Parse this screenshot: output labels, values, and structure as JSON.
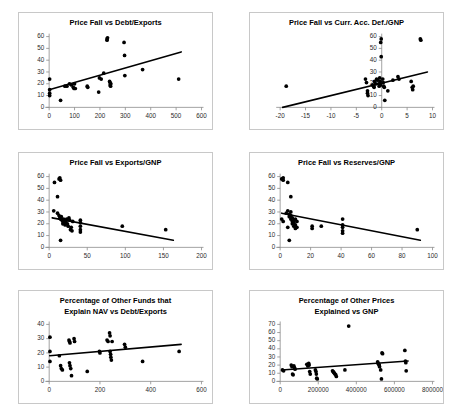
{
  "figure": {
    "background_color": "#ffffff",
    "panel_border_color": "#c8c8c8",
    "marker_color": "#000000",
    "trendline_color": "#000000",
    "axis_color": "#8a8a8a"
  },
  "chart_data": [
    {
      "id": "price-fall-vs-debt-exports",
      "type": "scatter",
      "title": "Price Fall vs Debt/Exports",
      "title_lines": [
        "Price Fall vs Debt/Exports"
      ],
      "xlabel": "",
      "ylabel": "",
      "xlim": [
        0,
        600
      ],
      "ylim": [
        0,
        60
      ],
      "xticks": [
        0,
        100,
        200,
        300,
        400,
        500,
        600
      ],
      "yticks": [
        0,
        10,
        20,
        30,
        40,
        50,
        60
      ],
      "grid": false,
      "legend": false,
      "points": [
        [
          2,
          24
        ],
        [
          2,
          15
        ],
        [
          2,
          12
        ],
        [
          2,
          10
        ],
        [
          45,
          6
        ],
        [
          62,
          18
        ],
        [
          70,
          18
        ],
        [
          80,
          20
        ],
        [
          88,
          19
        ],
        [
          95,
          17
        ],
        [
          98,
          16
        ],
        [
          100,
          20
        ],
        [
          103,
          16
        ],
        [
          150,
          18
        ],
        [
          152,
          17
        ],
        [
          195,
          13
        ],
        [
          198,
          25
        ],
        [
          205,
          24
        ],
        [
          215,
          29
        ],
        [
          228,
          58
        ],
        [
          228,
          57
        ],
        [
          230,
          59
        ],
        [
          238,
          22
        ],
        [
          240,
          21
        ],
        [
          240,
          19
        ],
        [
          242,
          18
        ],
        [
          243,
          20
        ],
        [
          295,
          55
        ],
        [
          297,
          44
        ],
        [
          298,
          27
        ],
        [
          368,
          32
        ],
        [
          510,
          24
        ]
      ],
      "trend": {
        "x1": 0,
        "y1": 15,
        "x2": 520,
        "y2": 47
      }
    },
    {
      "id": "price-fall-vs-curr-acc-def-gnp",
      "type": "scatter",
      "title": "Price Fall vs Curr. Acc. Def./GNP",
      "title_lines": [
        "Price Fall vs Curr. Acc. Def./GNP"
      ],
      "xlabel": "",
      "ylabel": "",
      "xlim": [
        -20,
        10
      ],
      "ylim": [
        0,
        60
      ],
      "xticks": [
        -20,
        -15,
        -10,
        -5,
        0,
        5,
        10
      ],
      "yticks": [
        0,
        10,
        20,
        30,
        40,
        50,
        60
      ],
      "grid": false,
      "legend": false,
      "points": [
        [
          -18.8,
          18
        ],
        [
          -3.2,
          24
        ],
        [
          -3.0,
          21
        ],
        [
          -2.8,
          14
        ],
        [
          -2.8,
          12
        ],
        [
          -2.7,
          10
        ],
        [
          -1.8,
          19
        ],
        [
          -1.6,
          18
        ],
        [
          -1.5,
          17
        ],
        [
          -1.4,
          22
        ],
        [
          -1.2,
          20
        ],
        [
          -1.0,
          24
        ],
        [
          -0.8,
          23
        ],
        [
          -0.6,
          20
        ],
        [
          -0.5,
          18
        ],
        [
          -0.4,
          25
        ],
        [
          -0.3,
          22
        ],
        [
          -0.2,
          19
        ],
        [
          -0.2,
          55
        ],
        [
          -0.1,
          58
        ],
        [
          -0.1,
          43
        ],
        [
          0.2,
          24
        ],
        [
          0.3,
          21
        ],
        [
          0.4,
          18
        ],
        [
          0.5,
          17
        ],
        [
          0.6,
          6
        ],
        [
          1.2,
          14
        ],
        [
          2.2,
          23
        ],
        [
          3.2,
          26
        ],
        [
          3.4,
          24
        ],
        [
          5.8,
          22
        ],
        [
          6.0,
          17
        ],
        [
          6.1,
          15
        ],
        [
          6.2,
          18
        ],
        [
          7.6,
          58
        ],
        [
          7.7,
          57
        ]
      ],
      "trend": {
        "x1": -19.5,
        "y1": 0,
        "x2": 9.0,
        "y2": 30
      }
    },
    {
      "id": "price-fall-vs-exports-gnp",
      "type": "scatter",
      "title": "Price Fall vs Exports/GNP",
      "title_lines": [
        "Price Fall vs Exports/GNP"
      ],
      "xlabel": "",
      "ylabel": "",
      "xlim": [
        0,
        200
      ],
      "ylim": [
        0,
        60
      ],
      "xticks": [
        0,
        50,
        100,
        150,
        200
      ],
      "yticks": [
        0,
        10,
        20,
        30,
        40,
        50,
        60
      ],
      "grid": false,
      "legend": false,
      "points": [
        [
          7,
          55
        ],
        [
          13,
          58
        ],
        [
          14,
          59
        ],
        [
          15,
          57
        ],
        [
          11,
          43
        ],
        [
          6,
          31
        ],
        [
          11,
          29
        ],
        [
          13,
          27
        ],
        [
          14,
          25
        ],
        [
          15,
          24
        ],
        [
          16,
          26
        ],
        [
          17,
          23
        ],
        [
          18,
          22
        ],
        [
          18,
          20
        ],
        [
          19,
          24
        ],
        [
          20,
          21
        ],
        [
          21,
          19
        ],
        [
          22,
          22
        ],
        [
          23,
          24
        ],
        [
          24,
          20
        ],
        [
          25,
          18
        ],
        [
          26,
          25
        ],
        [
          27,
          23
        ],
        [
          28,
          15
        ],
        [
          29,
          17
        ],
        [
          30,
          14
        ],
        [
          31,
          22
        ],
        [
          15,
          6
        ],
        [
          41,
          23
        ],
        [
          41,
          21
        ],
        [
          41,
          18
        ],
        [
          41,
          15
        ],
        [
          41,
          13
        ],
        [
          96,
          18
        ],
        [
          153,
          15
        ]
      ],
      "trend": {
        "x1": 4,
        "y1": 25,
        "x2": 163,
        "y2": 6
      }
    },
    {
      "id": "price-fall-vs-reserves-gnp",
      "type": "scatter",
      "title": "Price Fall vs Reserves/GNP",
      "title_lines": [
        "Price Fall vs Reserves/GNP"
      ],
      "xlabel": "",
      "ylabel": "",
      "xlim": [
        0,
        100
      ],
      "ylim": [
        0,
        60
      ],
      "xticks": [
        0,
        20,
        40,
        60,
        80,
        100
      ],
      "yticks": [
        0,
        10,
        20,
        30,
        40,
        50,
        60
      ],
      "grid": false,
      "legend": false,
      "points": [
        [
          1,
          58
        ],
        [
          2,
          57
        ],
        [
          2,
          59
        ],
        [
          5,
          55
        ],
        [
          7,
          43
        ],
        [
          1,
          24
        ],
        [
          2,
          22
        ],
        [
          4,
          29
        ],
        [
          5,
          31
        ],
        [
          6,
          28
        ],
        [
          6,
          26
        ],
        [
          7,
          30
        ],
        [
          7,
          27
        ],
        [
          7,
          24
        ],
        [
          8,
          25
        ],
        [
          8,
          22
        ],
        [
          8,
          20
        ],
        [
          9,
          23
        ],
        [
          9,
          21
        ],
        [
          9,
          18
        ],
        [
          10,
          24
        ],
        [
          10,
          19
        ],
        [
          10,
          16
        ],
        [
          11,
          22
        ],
        [
          11,
          17
        ],
        [
          5,
          17
        ],
        [
          6,
          6
        ],
        [
          21,
          18
        ],
        [
          21,
          16
        ],
        [
          27,
          18
        ],
        [
          41,
          24
        ],
        [
          41,
          19
        ],
        [
          41,
          17
        ],
        [
          41,
          14
        ],
        [
          41,
          12
        ],
        [
          90,
          15
        ]
      ],
      "trend": {
        "x1": 1,
        "y1": 29,
        "x2": 92,
        "y2": 6
      }
    },
    {
      "id": "pct-other-funds-explain-nav-vs-debt-exports",
      "type": "scatter",
      "title": "Percentage of Other Funds that Explain NAV vs Debt/Exports",
      "title_lines": [
        "Percentage of Other Funds that",
        "Explain NAV vs Debt/Exports"
      ],
      "xlabel": "",
      "ylabel": "",
      "xlim": [
        0,
        600
      ],
      "ylim": [
        0,
        40
      ],
      "xticks": [
        0,
        200,
        400,
        600
      ],
      "yticks": [
        0,
        10,
        20,
        30,
        40
      ],
      "grid": false,
      "legend": false,
      "points": [
        [
          3,
          31
        ],
        [
          3,
          21
        ],
        [
          3,
          14
        ],
        [
          40,
          18
        ],
        [
          45,
          11
        ],
        [
          48,
          9
        ],
        [
          52,
          8
        ],
        [
          78,
          29
        ],
        [
          80,
          28
        ],
        [
          82,
          27
        ],
        [
          80,
          13
        ],
        [
          82,
          11
        ],
        [
          85,
          9
        ],
        [
          88,
          4
        ],
        [
          98,
          30
        ],
        [
          100,
          28
        ],
        [
          150,
          7
        ],
        [
          198,
          21
        ],
        [
          200,
          20
        ],
        [
          228,
          29
        ],
        [
          232,
          28
        ],
        [
          238,
          34
        ],
        [
          240,
          32
        ],
        [
          240,
          21
        ],
        [
          242,
          19
        ],
        [
          243,
          17
        ],
        [
          245,
          15
        ],
        [
          248,
          28
        ],
        [
          297,
          26
        ],
        [
          300,
          24
        ],
        [
          368,
          14
        ],
        [
          512,
          21
        ]
      ],
      "trend": {
        "x1": 2,
        "y1": 18,
        "x2": 520,
        "y2": 26
      }
    },
    {
      "id": "pct-other-prices-explained-vs-gnp",
      "type": "scatter",
      "title": "Percentage of Other Prices Explained vs GNP",
      "title_lines": [
        "Percentage of Other Prices",
        "Explained vs GNP"
      ],
      "xlabel": "",
      "ylabel": "",
      "xlim": [
        0,
        800000
      ],
      "ylim": [
        0,
        70
      ],
      "xticks": [
        0,
        200000,
        400000,
        600000,
        800000
      ],
      "yticks": [
        0,
        10,
        20,
        30,
        40,
        50,
        60,
        70
      ],
      "grid": false,
      "legend": false,
      "points": [
        [
          12000,
          14
        ],
        [
          18000,
          13
        ],
        [
          58000,
          20
        ],
        [
          62000,
          18
        ],
        [
          65000,
          9
        ],
        [
          68000,
          8
        ],
        [
          72000,
          19
        ],
        [
          75000,
          17
        ],
        [
          78000,
          15
        ],
        [
          140000,
          21
        ],
        [
          145000,
          19
        ],
        [
          150000,
          22
        ],
        [
          152000,
          20
        ],
        [
          155000,
          12
        ],
        [
          158000,
          9
        ],
        [
          185000,
          14
        ],
        [
          188000,
          12
        ],
        [
          190000,
          9
        ],
        [
          192000,
          4
        ],
        [
          195000,
          3
        ],
        [
          275000,
          13
        ],
        [
          278000,
          12
        ],
        [
          282000,
          11
        ],
        [
          285000,
          10
        ],
        [
          288000,
          9
        ],
        [
          292000,
          8
        ],
        [
          295000,
          6
        ],
        [
          340000,
          14
        ],
        [
          360000,
          68
        ],
        [
          512000,
          24
        ],
        [
          515000,
          22
        ],
        [
          518000,
          21
        ],
        [
          520000,
          20
        ],
        [
          522000,
          18
        ],
        [
          528000,
          14
        ],
        [
          532000,
          3
        ],
        [
          535000,
          35
        ],
        [
          538000,
          34
        ],
        [
          655000,
          38
        ],
        [
          658000,
          25
        ],
        [
          660000,
          23
        ],
        [
          662000,
          13
        ]
      ],
      "trend": {
        "x1": 8000,
        "y1": 14,
        "x2": 672000,
        "y2": 25
      }
    }
  ]
}
